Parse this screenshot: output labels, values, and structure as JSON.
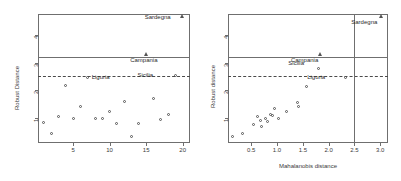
{
  "figure": {
    "background": "#ffffff",
    "frame_color": "#6f6f6f",
    "point_color": "#555555",
    "panels": [
      "left-robust-distance-index",
      "right-distance-distance"
    ]
  },
  "chart_data": [
    {
      "type": "scatter",
      "id": "left-panel",
      "title": "",
      "xlabel": "",
      "ylabel": "Robust Distance",
      "xlim": [
        0.2,
        21.0
      ],
      "ylim": [
        0.1,
        4.75
      ],
      "xticks": [
        5,
        10,
        15,
        20
      ],
      "xticklabels": [
        "5",
        "10",
        "15",
        "20"
      ],
      "yticks": [
        1,
        2,
        3,
        4
      ],
      "yticklabels": [
        "1",
        "2",
        "3",
        "4"
      ],
      "grid": false,
      "legend": "none",
      "hlines": [
        {
          "y": 3.2,
          "style": "solid"
        },
        {
          "y": 2.5,
          "style": "dashed"
        }
      ],
      "series": [
        {
          "name": "regular-observations",
          "marker": "circle",
          "points": [
            {
              "x": 1.0,
              "y": 0.85
            },
            {
              "x": 2.0,
              "y": 0.46
            },
            {
              "x": 3.0,
              "y": 1.07
            },
            {
              "x": 4.0,
              "y": 2.17
            },
            {
              "x": 5.0,
              "y": 0.97
            },
            {
              "x": 6.0,
              "y": 1.42
            },
            {
              "x": 8.0,
              "y": 0.97
            },
            {
              "x": 9.0,
              "y": 0.97
            },
            {
              "x": 10.0,
              "y": 1.23
            },
            {
              "x": 11.0,
              "y": 0.79
            },
            {
              "x": 12.0,
              "y": 1.6
            },
            {
              "x": 13.0,
              "y": 0.35
            },
            {
              "x": 14.0,
              "y": 0.79
            },
            {
              "x": 16.0,
              "y": 1.7
            },
            {
              "x": 17.0,
              "y": 0.96
            },
            {
              "x": 18.0,
              "y": 1.12
            },
            {
              "x": 7.0,
              "y": 2.45
            },
            {
              "x": 19.0,
              "y": 2.52
            }
          ]
        },
        {
          "name": "outliers",
          "marker": "triangle",
          "points": [
            {
              "x": 20.0,
              "y": 4.62
            },
            {
              "x": 15.0,
              "y": 3.25
            }
          ]
        }
      ],
      "annotations": [
        {
          "text": "Sardegna",
          "x": 20.0,
          "y": 4.62,
          "anchor": "left"
        },
        {
          "text": "Campania",
          "x": 15.0,
          "y": 3.25,
          "anchor": "below"
        },
        {
          "text": "Sicilia",
          "x": 19.0,
          "y": 2.52,
          "anchor": "left"
        },
        {
          "text": "Liguria",
          "x": 7.0,
          "y": 2.45,
          "anchor": "right"
        }
      ]
    },
    {
      "type": "scatter",
      "id": "right-panel",
      "title": "",
      "xlabel": "Mahalanobis distance",
      "ylabel": "Robust distance",
      "xlim": [
        0.05,
        3.15
      ],
      "ylim": [
        0.1,
        4.75
      ],
      "xticks": [
        0.5,
        1.0,
        1.5,
        2.0,
        2.5,
        3.0
      ],
      "xticklabels": [
        "0.5",
        "1.0",
        "1.5",
        "2.0",
        "2.5",
        "3.0"
      ],
      "yticks": [
        1,
        2,
        3,
        4
      ],
      "yticklabels": [
        "1",
        "2",
        "3",
        "4"
      ],
      "grid": false,
      "legend": "none",
      "hlines": [
        {
          "y": 3.2,
          "style": "solid"
        },
        {
          "y": 2.5,
          "style": "dashed"
        }
      ],
      "vlines": [
        {
          "x": 2.5,
          "style": "solid"
        }
      ],
      "series": [
        {
          "name": "regular-observations",
          "marker": "circle",
          "points": [
            {
              "x": 0.13,
              "y": 0.33
            },
            {
              "x": 0.33,
              "y": 0.45
            },
            {
              "x": 0.55,
              "y": 0.78
            },
            {
              "x": 0.62,
              "y": 1.06
            },
            {
              "x": 0.67,
              "y": 0.92
            },
            {
              "x": 0.7,
              "y": 0.71
            },
            {
              "x": 0.78,
              "y": 0.98
            },
            {
              "x": 0.82,
              "y": 0.87
            },
            {
              "x": 0.88,
              "y": 1.12
            },
            {
              "x": 0.92,
              "y": 1.08
            },
            {
              "x": 0.95,
              "y": 1.35
            },
            {
              "x": 1.02,
              "y": 0.98
            },
            {
              "x": 1.18,
              "y": 1.22
            },
            {
              "x": 1.4,
              "y": 1.55
            },
            {
              "x": 1.42,
              "y": 1.42
            },
            {
              "x": 1.58,
              "y": 2.12
            },
            {
              "x": 1.8,
              "y": 2.78
            },
            {
              "x": 2.32,
              "y": 2.45
            }
          ]
        },
        {
          "name": "outliers",
          "marker": "triangle",
          "points": [
            {
              "x": 3.02,
              "y": 4.62
            },
            {
              "x": 1.85,
              "y": 3.25
            }
          ]
        }
      ],
      "annotations": [
        {
          "text": "Sardegna",
          "x": 3.02,
          "y": 4.62,
          "anchor": "below-left"
        },
        {
          "text": "Campania",
          "x": 1.85,
          "y": 3.25,
          "anchor": "below-left"
        },
        {
          "text": "Sicilia",
          "x": 1.8,
          "y": 2.78,
          "anchor": "above"
        },
        {
          "text": "Liguria",
          "x": 2.32,
          "y": 2.45,
          "anchor": "left"
        }
      ]
    }
  ]
}
